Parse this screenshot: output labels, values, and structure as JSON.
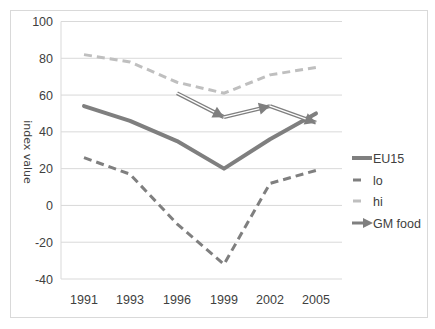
{
  "chart_data": {
    "type": "line",
    "title": "",
    "xlabel": "",
    "ylabel": "index value",
    "ylim": [
      -40,
      100
    ],
    "yticks": [
      100,
      80,
      60,
      40,
      20,
      0,
      -20,
      -40
    ],
    "categories": [
      "1991",
      "1993",
      "1996",
      "1999",
      "2002",
      "2005"
    ],
    "grid": true,
    "legend_position": "right",
    "series": [
      {
        "name": "EU15",
        "style": "solid-thick",
        "color": "#7f7f7f",
        "values": [
          54,
          46,
          35,
          20,
          36,
          50
        ]
      },
      {
        "name": "lo",
        "style": "dashed",
        "color": "#7f7f7f",
        "values": [
          26,
          17,
          -10,
          -32,
          12,
          19
        ]
      },
      {
        "name": "hi",
        "style": "dashed-light",
        "color": "#bfbfbf",
        "values": [
          82,
          78,
          67,
          61,
          71,
          75
        ]
      },
      {
        "name": "GM food",
        "style": "arrow",
        "color": "#808080",
        "values": [
          null,
          null,
          61,
          48,
          54,
          45
        ]
      }
    ]
  },
  "legend": {
    "items": [
      "EU15",
      "lo",
      "hi",
      "GM food"
    ]
  },
  "axis": {
    "ylabel": "index value"
  }
}
